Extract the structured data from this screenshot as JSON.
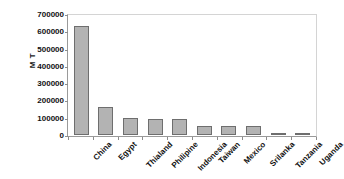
{
  "chart_data": {
    "type": "bar",
    "title": "",
    "subtitle": "",
    "xlabel": "",
    "ylabel": "M T",
    "categories": [
      "China",
      "Egypt",
      "Thialand",
      "Philipine",
      "Indonesia",
      "Taiwan",
      "Mexico",
      "Srilanka",
      "Tanzania",
      "Uganda"
    ],
    "values": [
      630000,
      160000,
      100000,
      92000,
      92000,
      50000,
      50000,
      50000,
      12000,
      12000
    ],
    "ylim": [
      0,
      700000
    ],
    "ytick_labels": [
      "700000",
      "600000",
      "500000",
      "400000",
      "300000",
      "200000",
      "100000",
      "0"
    ],
    "ytick_values": [
      700000,
      600000,
      500000,
      400000,
      300000,
      200000,
      100000,
      0
    ],
    "grid": false,
    "legend": null,
    "bar_color": "#b3b3b3",
    "bar_edge_color": "#6e6e6e",
    "axis_color": "#9a9a9a",
    "text_color": "#111111"
  }
}
